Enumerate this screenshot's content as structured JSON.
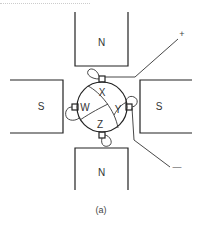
{
  "figure": {
    "caption": "(a)",
    "poles": {
      "top": "N",
      "bottom": "N",
      "left": "S",
      "right": "S"
    },
    "rotor_segments": {
      "top": "X",
      "right": "Y",
      "bottom": "Z",
      "left": "W"
    },
    "terminals": {
      "positive": "+",
      "negative": "—"
    },
    "colors": {
      "line": "#222222",
      "text": "#333333",
      "background": "#ffffff"
    }
  }
}
